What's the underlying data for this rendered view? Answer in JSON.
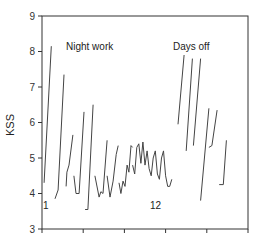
{
  "chart_data": {
    "type": "line",
    "title": "",
    "xlabel": "",
    "ylabel": "KSS",
    "ylim": [
      3,
      9
    ],
    "yticks": [
      3,
      4,
      5,
      6,
      7,
      8,
      9
    ],
    "xticks_count": 6,
    "xtick_labels": [],
    "grid": false,
    "legend": null,
    "annotations": [
      {
        "text": "Night work",
        "x_frac": 0.12,
        "kss": 8.2
      },
      {
        "text": "Days off",
        "x_frac": 0.61,
        "kss": 8.2
      },
      {
        "text": "1",
        "x_frac": 0.01,
        "kss": 3.35
      },
      {
        "text": "12",
        "x_frac": 0.5,
        "kss": 3.35
      }
    ],
    "segments": [
      {
        "label": "seg1",
        "points": [
          [
            0.01,
            4.3
          ],
          [
            0.045,
            8.15
          ]
        ]
      },
      {
        "label": "seg2",
        "points": [
          [
            0.063,
            3.85
          ],
          [
            0.078,
            4.1
          ],
          [
            0.107,
            7.35
          ]
        ]
      },
      {
        "label": "seg3",
        "points": [
          [
            0.117,
            4.2
          ],
          [
            0.121,
            4.6
          ],
          [
            0.131,
            4.8
          ],
          [
            0.15,
            5.65
          ]
        ]
      },
      {
        "label": "seg4",
        "points": [
          [
            0.155,
            4.5
          ],
          [
            0.165,
            4.0
          ],
          [
            0.18,
            4.0
          ],
          [
            0.204,
            6.3
          ]
        ]
      },
      {
        "label": "seg5",
        "points": [
          [
            0.209,
            3.55
          ],
          [
            0.223,
            3.55
          ],
          [
            0.248,
            6.5
          ]
        ]
      },
      {
        "label": "seg6",
        "points": [
          [
            0.257,
            4.5
          ],
          [
            0.277,
            3.9
          ],
          [
            0.286,
            4.05
          ],
          [
            0.296,
            4.0
          ],
          [
            0.316,
            5.5
          ]
        ]
      },
      {
        "label": "seg7",
        "points": [
          [
            0.316,
            4.5
          ],
          [
            0.33,
            3.9
          ],
          [
            0.345,
            4.35
          ],
          [
            0.36,
            5.1
          ],
          [
            0.37,
            5.35
          ]
        ]
      },
      {
        "label": "seg8",
        "points": [
          [
            0.374,
            4.3
          ],
          [
            0.383,
            4.0
          ],
          [
            0.393,
            4.35
          ],
          [
            0.403,
            4.2
          ],
          [
            0.413,
            4.8
          ],
          [
            0.422,
            4.6
          ],
          [
            0.432,
            5.35
          ],
          [
            0.44,
            5.3
          ]
        ]
      },
      {
        "label": "seg9",
        "points": [
          [
            0.44,
            4.8
          ],
          [
            0.45,
            4.55
          ],
          [
            0.46,
            5.3
          ],
          [
            0.47,
            5.4
          ],
          [
            0.48,
            4.85
          ],
          [
            0.49,
            5.45
          ],
          [
            0.5,
            4.8
          ],
          [
            0.51,
            5.2
          ],
          [
            0.52,
            4.7
          ],
          [
            0.53,
            4.5
          ],
          [
            0.54,
            5.0
          ],
          [
            0.55,
            5.2
          ],
          [
            0.56,
            4.55
          ],
          [
            0.57,
            4.4
          ],
          [
            0.58,
            5.0
          ],
          [
            0.59,
            5.2
          ],
          [
            0.6,
            4.5
          ],
          [
            0.61,
            4.2
          ],
          [
            0.62,
            4.2
          ],
          [
            0.63,
            4.4
          ]
        ]
      },
      {
        "label": "seg10",
        "points": [
          [
            0.66,
            5.95
          ],
          [
            0.69,
            7.9
          ]
        ]
      },
      {
        "label": "seg11",
        "points": [
          [
            0.7,
            5.2
          ],
          [
            0.73,
            7.8
          ]
        ]
      },
      {
        "label": "seg12",
        "points": [
          [
            0.735,
            5.35
          ],
          [
            0.77,
            7.8
          ]
        ]
      },
      {
        "label": "seg13",
        "points": [
          [
            0.77,
            3.8
          ],
          [
            0.81,
            6.4
          ]
        ]
      },
      {
        "label": "seg14",
        "points": [
          [
            0.81,
            5.3
          ],
          [
            0.825,
            5.35
          ],
          [
            0.85,
            6.35
          ]
        ]
      },
      {
        "label": "seg15",
        "points": [
          [
            0.86,
            4.25
          ],
          [
            0.88,
            4.25
          ],
          [
            0.895,
            5.5
          ]
        ]
      }
    ]
  },
  "labels": {
    "ylabel": "KSS",
    "night_work": "Night work",
    "days_off": "Days off",
    "start_marker": "1",
    "mid_marker": "12"
  }
}
